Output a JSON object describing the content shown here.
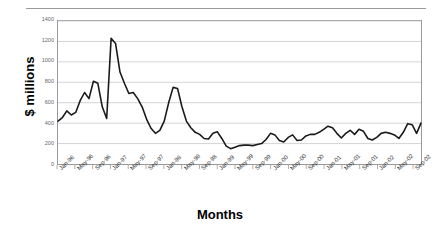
{
  "chart_data": {
    "type": "line",
    "title": "",
    "xlabel": "Months",
    "ylabel": "$ millions",
    "ylim": [
      0,
      1400
    ],
    "ytick_step": 200,
    "yticks": [
      1400,
      1200,
      1000,
      800,
      600,
      400,
      200,
      0
    ],
    "grid": true,
    "grid_axis": "y",
    "legend": "none",
    "line_color": "#1a1a1a",
    "axis_color": "#9a9a9a",
    "grid_color": "#c9c9c9",
    "tick_label_color": "#666666",
    "xtick_labels": [
      "Jan-96",
      "May-96",
      "Sep-96",
      "Jan-97",
      "May-97",
      "Sep-97",
      "Jan-98",
      "May-98",
      "Sep-98",
      "Jan-99",
      "May-99",
      "Sep-99",
      "Jan-00",
      "May-00",
      "Sep-00",
      "Jan-01",
      "May-01",
      "Sep-01",
      "Jan-02",
      "May-02",
      "Sep-02"
    ],
    "xtick_interval_months": 4,
    "x_start": "Jan-96",
    "x_end": "Nov-02",
    "x": [
      "Jan-96",
      "Feb-96",
      "Mar-96",
      "Apr-96",
      "May-96",
      "Jun-96",
      "Jul-96",
      "Aug-96",
      "Sep-96",
      "Oct-96",
      "Nov-96",
      "Dec-96",
      "Jan-97",
      "Feb-97",
      "Mar-97",
      "Apr-97",
      "May-97",
      "Jun-97",
      "Jul-97",
      "Aug-97",
      "Sep-97",
      "Oct-97",
      "Nov-97",
      "Dec-97",
      "Jan-98",
      "Feb-98",
      "Mar-98",
      "Apr-98",
      "May-98",
      "Jun-98",
      "Jul-98",
      "Aug-98",
      "Sep-98",
      "Oct-98",
      "Nov-98",
      "Dec-98",
      "Jan-99",
      "Feb-99",
      "Mar-99",
      "Apr-99",
      "May-99",
      "Jun-99",
      "Jul-99",
      "Aug-99",
      "Sep-99",
      "Oct-99",
      "Nov-99",
      "Dec-99",
      "Jan-00",
      "Feb-00",
      "Mar-00",
      "Apr-00",
      "May-00",
      "Jun-00",
      "Jul-00",
      "Aug-00",
      "Sep-00",
      "Oct-00",
      "Nov-00",
      "Dec-00",
      "Jan-01",
      "Feb-01",
      "Mar-01",
      "Apr-01",
      "May-01",
      "Jun-01",
      "Jul-01",
      "Aug-01",
      "Sep-01",
      "Oct-01",
      "Nov-01",
      "Dec-01",
      "Jan-02",
      "Feb-02",
      "Mar-02",
      "Apr-02",
      "May-02",
      "Jun-02",
      "Jul-02",
      "Aug-02",
      "Sep-02",
      "Oct-02",
      "Nov-02"
    ],
    "values": [
      420,
      455,
      520,
      480,
      505,
      620,
      700,
      640,
      810,
      790,
      560,
      445,
      1230,
      1180,
      900,
      790,
      690,
      700,
      640,
      560,
      440,
      350,
      300,
      330,
      420,
      600,
      750,
      740,
      560,
      420,
      355,
      310,
      290,
      250,
      245,
      300,
      315,
      250,
      175,
      150,
      165,
      180,
      185,
      185,
      180,
      190,
      200,
      240,
      300,
      285,
      230,
      215,
      260,
      285,
      230,
      235,
      275,
      290,
      290,
      310,
      340,
      370,
      355,
      300,
      255,
      300,
      330,
      290,
      340,
      320,
      250,
      235,
      260,
      300,
      310,
      300,
      285,
      250,
      310,
      395,
      385,
      300,
      400
    ],
    "series_name": ""
  },
  "figure": {
    "top_rule": true
  }
}
